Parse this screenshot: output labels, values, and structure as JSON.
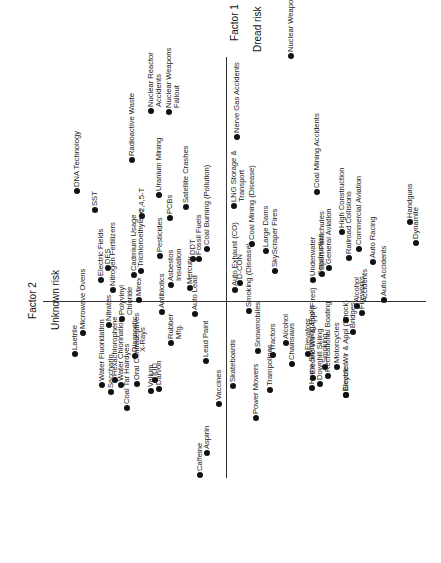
{
  "chart_data": {
    "type": "scatter",
    "title": "",
    "orientation": "rotated -90 degrees (text reads bottom-to-top)",
    "xlabel": "Factor 1\nDread risk",
    "ylabel": "Factor 2\nUnknown risk",
    "grid": false,
    "legend": null,
    "axes": {
      "factor1_line": {
        "x": 226,
        "y1": 57,
        "y2": 478
      },
      "factor2_line": {
        "y": 301,
        "x1": 43,
        "x2": 426
      }
    },
    "points": [
      {
        "label": "DNA Technology",
        "x": 77,
        "y": 191
      },
      {
        "label": "SST",
        "x": 95,
        "y": 210
      },
      {
        "label": "Electric Fields",
        "x": 101,
        "y": 280
      },
      {
        "label": "DES",
        "x": 108,
        "y": 268
      },
      {
        "label": "Nitrogen Fertilizers",
        "x": 113,
        "y": 290
      },
      {
        "label": "Radioactive Waste",
        "x": 132,
        "y": 160
      },
      {
        "label": "Nuclear Reactor\nAccidents",
        "x": 151,
        "y": 111
      },
      {
        "label": "Nuclear Weapons\nFallout",
        "x": 169,
        "y": 112
      },
      {
        "label": "Cadmium Usage",
        "x": 134,
        "y": 275
      },
      {
        "label": "2,4,5-T",
        "x": 142,
        "y": 216
      },
      {
        "label": "Trichloroethylene",
        "x": 141,
        "y": 271
      },
      {
        "label": "Mirex",
        "x": 139,
        "y": 300
      },
      {
        "label": "Uranium Mining",
        "x": 159,
        "y": 195
      },
      {
        "label": "Pesticides",
        "x": 160,
        "y": 256
      },
      {
        "label": "PCBs",
        "x": 170,
        "y": 218
      },
      {
        "label": "Asbestos\nInsulation",
        "x": 171,
        "y": 285
      },
      {
        "label": "Satellite Crashes",
        "x": 186,
        "y": 207
      },
      {
        "label": "DDT",
        "x": 193,
        "y": 259
      },
      {
        "label": "Fossil Fuels",
        "x": 199,
        "y": 259
      },
      {
        "label": "Coal Burning (Pollution)",
        "x": 207,
        "y": 249
      },
      {
        "label": "Mercury",
        "x": 190,
        "y": 288
      },
      {
        "label": "Auto Exhaust (CO)",
        "x": 235,
        "y": 290
      },
      {
        "label": "D-CON",
        "x": 240,
        "y": 283
      },
      {
        "label": "LNG Storage &\nTransport",
        "x": 234,
        "y": 206
      },
      {
        "label": "Nerve Gas Accidents",
        "x": 237,
        "y": 137
      },
      {
        "label": "Coal Mining (Disease)",
        "x": 252,
        "y": 244
      },
      {
        "label": "Large Dams",
        "x": 266,
        "y": 251
      },
      {
        "label": "SkyScraper Fires",
        "x": 275,
        "y": 271
      },
      {
        "label": "Nuclear Weapons (War)",
        "x": 291,
        "y": 56
      },
      {
        "label": "Coal Mining Accidents",
        "x": 317,
        "y": 192
      },
      {
        "label": "Underwater\nConstruction",
        "x": 313,
        "y": 280
      },
      {
        "label": "Sport Parachutes",
        "x": 322,
        "y": 274
      },
      {
        "label": "General Aviation",
        "x": 329,
        "y": 268
      },
      {
        "label": "High Construction",
        "x": 342,
        "y": 232
      },
      {
        "label": "Railroad Collisions",
        "x": 349,
        "y": 258
      },
      {
        "label": "Commercial Aviation",
        "x": 359,
        "y": 249
      },
      {
        "label": "Auto Racing",
        "x": 373,
        "y": 262
      },
      {
        "label": "Auto Accidents",
        "x": 384,
        "y": 300
      },
      {
        "label": "Handguns",
        "x": 410,
        "y": 222
      },
      {
        "label": "Dynamite",
        "x": 416,
        "y": 243
      },
      {
        "label": "Alcohol\nAccidents",
        "x": 357,
        "y": 306
      },
      {
        "label": "Fireworks",
        "x": 362,
        "y": 313
      },
      {
        "label": "Laetrile",
        "x": 75,
        "y": 354
      },
      {
        "label": "Microwave Ovens",
        "x": 83,
        "y": 333
      },
      {
        "label": "Nitrates",
        "x": 109,
        "y": 325
      },
      {
        "label": "Hexachlorophene",
        "x": 115,
        "y": 380
      },
      {
        "label": "Polyvinyl\nChloride",
        "x": 122,
        "y": 319
      },
      {
        "label": "Diagnostic\nX-Rays",
        "x": 135,
        "y": 356
      },
      {
        "label": "Water Fluoridation",
        "x": 102,
        "y": 385
      },
      {
        "label": "Saccharin",
        "x": 111,
        "y": 392
      },
      {
        "label": "Water Chlorination",
        "x": 121,
        "y": 385
      },
      {
        "label": "Coal Tar Hairdyes",
        "x": 127,
        "y": 408
      },
      {
        "label": "Oral Contraceptives",
        "x": 137,
        "y": 384
      },
      {
        "label": "Valium",
        "x": 151,
        "y": 391
      },
      {
        "label": "IUD",
        "x": 155,
        "y": 380
      },
      {
        "label": "Darvon",
        "x": 159,
        "y": 389
      },
      {
        "label": "Antibiotics",
        "x": 162,
        "y": 312
      },
      {
        "label": "Rubber\nMfg.",
        "x": 171,
        "y": 343
      },
      {
        "label": "Auto Lead",
        "x": 195,
        "y": 314
      },
      {
        "label": "Lead Paint",
        "x": 206,
        "y": 361
      },
      {
        "label": "Vaccines",
        "x": 219,
        "y": 404
      },
      {
        "label": "Caffeine",
        "x": 200,
        "y": 475
      },
      {
        "label": "Aspirin",
        "x": 207,
        "y": 453
      },
      {
        "label": "Skateboards",
        "x": 233,
        "y": 386
      },
      {
        "label": "Smoking (Disease)",
        "x": 249,
        "y": 311
      },
      {
        "label": "Snowmobiles",
        "x": 258,
        "y": 351
      },
      {
        "label": "Power Mowers",
        "x": 256,
        "y": 418
      },
      {
        "label": "Trampolines",
        "x": 270,
        "y": 390
      },
      {
        "label": "Tractors",
        "x": 273,
        "y": 355
      },
      {
        "label": "Alcohol",
        "x": 286,
        "y": 343
      },
      {
        "label": "Chainsaws",
        "x": 292,
        "y": 364
      },
      {
        "label": "Elevators",
        "x": 308,
        "y": 354
      },
      {
        "label": "Electric Wir & Appl (Fires)",
        "x": 313,
        "y": 378
      },
      {
        "label": "Home Swimming Pools",
        "x": 312,
        "y": 388
      },
      {
        "label": "Downhill Skiing",
        "x": 320,
        "y": 384
      },
      {
        "label": "Smoking",
        "x": 325,
        "y": 367
      },
      {
        "label": "Recreational Boating",
        "x": 328,
        "y": 376
      },
      {
        "label": "Motorcycles",
        "x": 337,
        "y": 367
      },
      {
        "label": "Electric Wir & Appl (Shock)",
        "x": 346,
        "y": 395
      },
      {
        "label": "Bicycles",
        "x": 346,
        "y": 395
      },
      {
        "label": "Bridges",
        "x": 353,
        "y": 332
      },
      {
        "label": "Motorcycles2",
        "x": 346,
        "y": 320
      }
    ]
  },
  "axis_labels": {
    "factor1_line1": "Factor 1",
    "factor1_line2": "Dread risk",
    "factor2_line1": "Factor 2",
    "factor2_line2": "Unknown risk"
  }
}
